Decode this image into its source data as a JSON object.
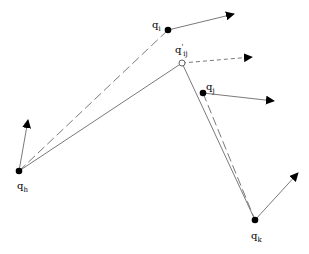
{
  "diagram": {
    "nodes": [
      {
        "id": "qh",
        "base": "q",
        "sub": "h",
        "sup": "",
        "x": 19,
        "y": 171,
        "style": "filled",
        "label_x": 17,
        "label_y": 181,
        "arrow_to": [
          28,
          120
        ]
      },
      {
        "id": "qi",
        "base": "q",
        "sub": "i",
        "sup": "",
        "x": 168,
        "y": 30,
        "style": "filled",
        "label_x": 152,
        "label_y": 20,
        "arrow_to": [
          234,
          14
        ]
      },
      {
        "id": "qij",
        "base": "q",
        "sub": "ij",
        "sup": "'",
        "x": 182,
        "y": 63,
        "style": "hollow",
        "label_x": 175,
        "label_y": 44,
        "arrow_to": [
          252,
          57
        ],
        "arrow_dashed": true
      },
      {
        "id": "qj",
        "base": "q",
        "sub": "j",
        "sup": "",
        "x": 203,
        "y": 93,
        "style": "filled",
        "label_x": 206,
        "label_y": 82,
        "arrow_to": [
          274,
          101
        ]
      },
      {
        "id": "qk",
        "base": "q",
        "sub": "k",
        "sup": "",
        "x": 255,
        "y": 220,
        "style": "filled",
        "label_x": 251,
        "label_y": 231,
        "arrow_to": [
          298,
          173
        ]
      }
    ],
    "edges": [
      {
        "from": "qh",
        "to": "qij",
        "style": "solid"
      },
      {
        "from": "qij",
        "to": "qk",
        "style": "solid"
      },
      {
        "from": "qh",
        "to": "qi",
        "style": "dashed"
      },
      {
        "from": "qj",
        "to": "qk",
        "style": "dashed"
      }
    ],
    "colors": {
      "line": "#7a7a7a",
      "node": "#000000",
      "arrowhead": "#000000"
    }
  }
}
